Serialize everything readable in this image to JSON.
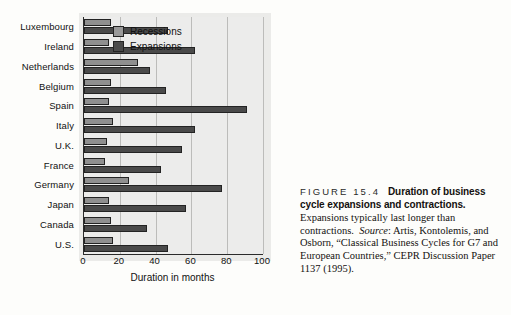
{
  "chart_data": {
    "type": "bar",
    "orientation": "horizontal",
    "title": "",
    "xlabel": "Duration in months",
    "ylabel": "",
    "xlim": [
      0,
      100
    ],
    "xticks": [
      0,
      20,
      40,
      60,
      80,
      100
    ],
    "grid": true,
    "legend_position": "inside-top-right",
    "categories": [
      "Luxembourg",
      "Ireland",
      "Netherlands",
      "Belgium",
      "Spain",
      "Italy",
      "U.K.",
      "France",
      "Germany",
      "Japan",
      "Canada",
      "U.S."
    ],
    "series": [
      {
        "name": "Recessions",
        "color": "#8f8f8f",
        "values": [
          15,
          14,
          30,
          15,
          14,
          16,
          13,
          12,
          25,
          14,
          15,
          16
        ]
      },
      {
        "name": "Expansions",
        "color": "#4a4a4a",
        "values": [
          47,
          62,
          37,
          46,
          91,
          62,
          55,
          43,
          77,
          57,
          35,
          47
        ]
      }
    ]
  },
  "legend": {
    "entries": [
      {
        "label": "Recessions",
        "swatch": "rec"
      },
      {
        "label": "Expansions",
        "swatch": "exp"
      }
    ]
  },
  "axis": {
    "x_title": "Duration in months"
  },
  "caption": {
    "figure_number": "FIGURE 15.4",
    "headline": "Duration of business cycle expansions and contractions.",
    "body_before_source": "Expansions typically last longer than contractions.",
    "source_label": "Source",
    "source_text": ": Artis, Kontolemis, and Osborn, “Classical Business Cycles for G7 and European Countries,” CEPR Discussion Paper 1137 (1995)."
  }
}
